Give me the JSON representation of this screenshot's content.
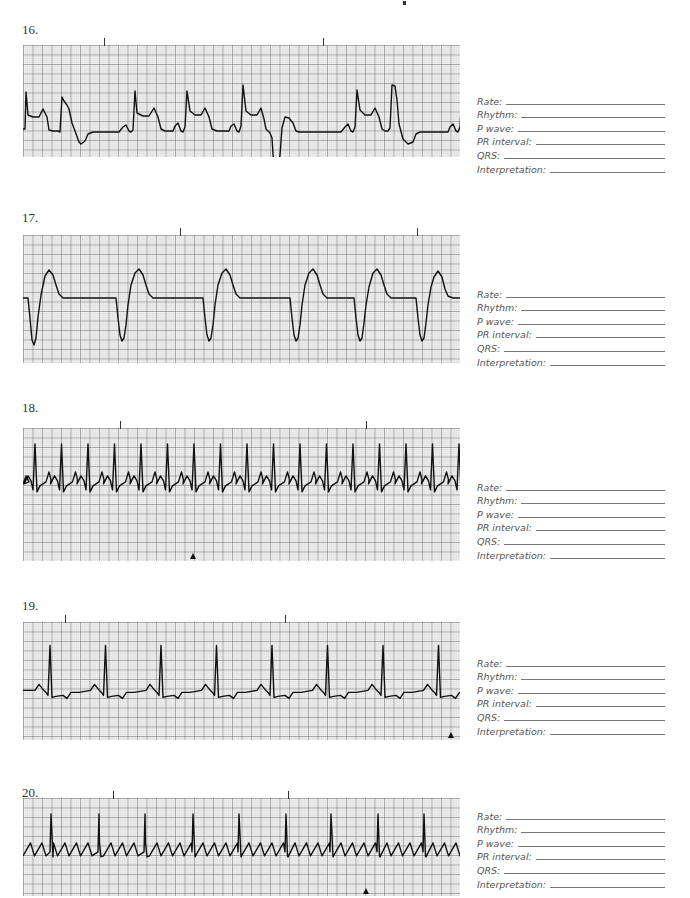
{
  "page": {
    "top_mark": "speck"
  },
  "form_labels": [
    "Rate:",
    "Rhythm:",
    "P wave:",
    "PR interval:",
    "QRS:",
    "Interpretation:"
  ],
  "exercises": [
    {
      "number": "16.",
      "label_top": 22,
      "strip": {
        "top": 45,
        "height": 112
      },
      "form_top": 93,
      "tick_marks": [
        81,
        300
      ],
      "marker": null,
      "trace": "0,84 2,84 3,47 5,70 10,72 16,72 20,64 24,72 26,85 30,86 35,86 37,87 39,52 41,56 44,60 46,64 49,78 52,86 56,97 58,99 62,96 65,89 70,87 80,87 96,87 100,82 103,80 106,86 108,87 110,85 112,46 114,68 120,71 126,71 131,63 135,72 138,84 142,86 146,86 150,86 152,81 155,78 158,86 160,87 162,82 164,46 167,66 172,70 178,70 182,63 186,72 189,84 194,86 200,86 206,86 208,81 211,79 214,86 216,87 218,81 220,40 223,66 228,70 234,70 238,63 241,74 243,84 247,88 249,93 252,140 254,131 257,110 259,83 262,72 266,73 270,78 273,86 276,87 290,87 300,87 318,87 322,82 325,79 328,86 330,87 332,82 334,45 337,65 342,70 348,70 352,63 356,72 359,84 362,86 365,86 367,83 369,40 372,41 374,55 376,79 380,94 385,99 390,97 393,89 397,87 410,87 425,87 427,82 430,79 433,86 435,87 437,82 439,45 440,62"
    },
    {
      "number": "17.",
      "label_top": 210,
      "strip": {
        "top": 235,
        "height": 128
      },
      "form_top": 286,
      "tick_marks": [
        157,
        394
      ],
      "marker": null,
      "trace": "0,63 5,63 7,83 9,105 11,110 13,103 15,82 18,60 22,41 26,35 30,40 33,50 36,59 40,63 60,63 75,63 93,63 95,83 97,100 99,106 101,103 103,90 105,70 108,50 112,38 116,34 120,40 123,50 126,59 130,63 150,63 170,63 180,63 182,83 184,100 186,106 188,103 190,90 192,70 195,50 199,38 203,34 207,40 210,50 213,59 217,63 240,63 257,63 267,63 269,83 271,100 273,106 275,103 277,90 279,70 282,50 286,38 290,34 294,40 297,50 300,59 304,63 320,63 331,63 333,83 335,100 337,106 339,103 341,88 343,70 346,52 350,38 354,34 358,40 361,50 364,59 368,63 380,63 393,63 395,83 397,100 399,106 401,103 403,88 405,70 408,52 411,42 415,36 419,42 422,54 425,61 430,63 437,63"
    },
    {
      "number": "18.",
      "label_top": 400,
      "strip": {
        "top": 428,
        "height": 133
      },
      "form_top": 479,
      "tick_marks": [
        97,
        343
      ],
      "marker": 170,
      "trace": "GEN:18"
    },
    {
      "number": "19.",
      "label_top": 598,
      "strip": {
        "top": 622,
        "height": 118
      },
      "form_top": 655,
      "tick_marks": [
        42,
        262
      ],
      "marker": 428,
      "trace": "GEN:19"
    },
    {
      "number": "20.",
      "label_top": 785,
      "strip": {
        "top": 798,
        "height": 98
      },
      "form_top": 808,
      "tick_marks": [
        90,
        265
      ],
      "marker": 343,
      "trace": "GEN:20"
    }
  ],
  "chart_data": [
    {
      "type": "line",
      "title": "16. ECG rhythm strip",
      "description": "sinus rhythm with wide bizarre premature complexes (PVCs), irregular",
      "beats": 10
    },
    {
      "type": "line",
      "title": "17. ECG rhythm strip",
      "description": "wide regular complexes, no P waves (idioventricular/ventricular rhythm)",
      "beats": 6
    },
    {
      "type": "line",
      "title": "18. ECG rhythm strip",
      "description": "rapid regular narrow complexes, tachycardia",
      "beats": 17
    },
    {
      "type": "line",
      "title": "19. ECG rhythm strip",
      "description": "regular narrow complexes with visible P waves",
      "beats": 8
    },
    {
      "type": "line",
      "title": "20. ECG rhythm strip",
      "description": "sawtooth flutter waves with narrow QRS complexes",
      "beats": 9
    }
  ]
}
